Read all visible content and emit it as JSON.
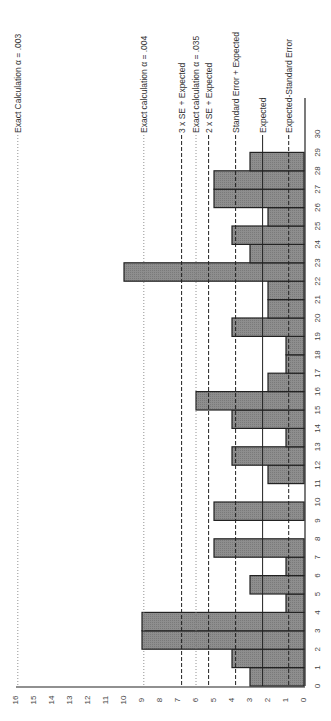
{
  "chart_data": {
    "type": "bar",
    "orientation": "rotated-90",
    "title": "",
    "xlabel": "",
    "ylabel": "",
    "categories": [
      0,
      1,
      2,
      3,
      4,
      5,
      6,
      7,
      8,
      9,
      10,
      11,
      12,
      13,
      14,
      15,
      16,
      17,
      18,
      19,
      20,
      21,
      22,
      23,
      24,
      25,
      26,
      27,
      28,
      29
    ],
    "values": [
      3,
      4,
      9,
      9,
      1,
      3,
      1,
      5,
      0,
      5,
      0,
      2,
      4,
      1,
      4,
      6,
      2,
      1,
      1,
      4,
      2,
      2,
      10,
      3,
      4,
      2,
      5,
      5,
      3,
      0
    ],
    "x_ticks": [
      0,
      1,
      2,
      3,
      4,
      5,
      6,
      7,
      8,
      9,
      10,
      11,
      12,
      13,
      14,
      15,
      16,
      17,
      18,
      19,
      20,
      21,
      22,
      23,
      24,
      25,
      26,
      27,
      28,
      29,
      30
    ],
    "y_ticks": [
      0,
      1,
      2,
      3,
      4,
      5,
      6,
      7,
      8,
      9,
      10,
      11,
      12,
      13,
      14,
      15,
      16
    ],
    "xlim": [
      0,
      30
    ],
    "ylim": [
      0,
      16
    ],
    "grid": false,
    "bar_color": "#8c8c8c",
    "reference_lines": [
      {
        "label": "Exact Calculation α = .003",
        "value": 15.9,
        "style": "dotted"
      },
      {
        "label": "Exact calculation α = .004",
        "value": 8.9,
        "style": "dotted"
      },
      {
        "label": "3 x SE + Expected",
        "value": 6.8,
        "style": "dashed"
      },
      {
        "label": "Exact calculation α = .035",
        "value": 6.0,
        "style": "dotted"
      },
      {
        "label": "2 x SE + Expected",
        "value": 5.3,
        "style": "dashed"
      },
      {
        "label": "Standard Error + Expected",
        "value": 3.8,
        "style": "dashed"
      },
      {
        "label": "Expected",
        "value": 2.3,
        "style": "solid"
      },
      {
        "label": "Expected-Standard Error",
        "value": 0.85,
        "style": "dashed"
      }
    ]
  }
}
